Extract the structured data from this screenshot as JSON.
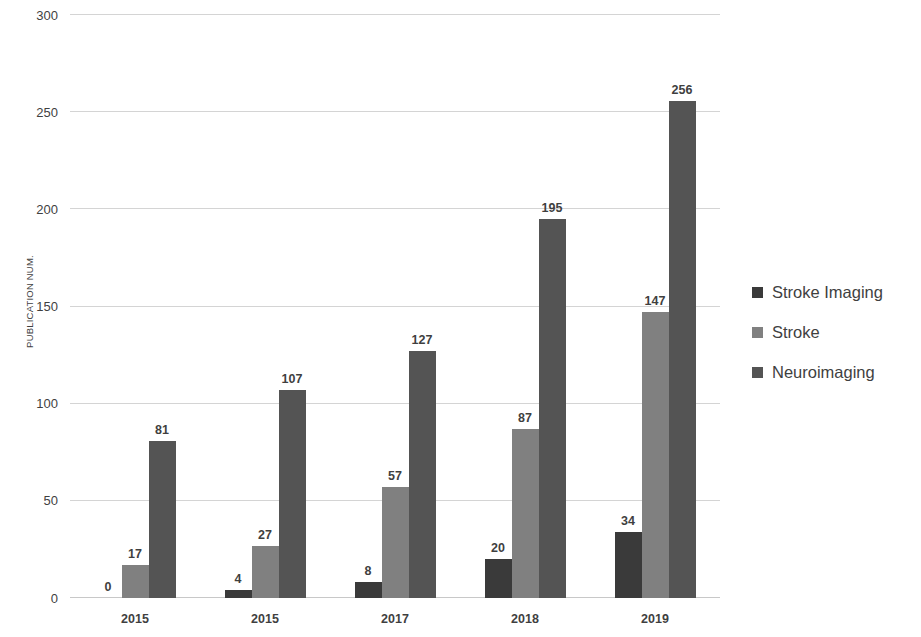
{
  "chart_data": {
    "type": "bar",
    "title": "",
    "subtitle": "",
    "xlabel": "",
    "ylabel": "PUBLICATION NUM.",
    "categories": [
      "2015",
      "2015",
      "2017",
      "2018",
      "2019"
    ],
    "series": [
      {
        "name": "Stroke Imaging",
        "color": "#3a3a3a",
        "values": [
          0,
          4,
          8,
          20,
          34
        ]
      },
      {
        "name": "Stroke",
        "color": "#808080",
        "values": [
          17,
          27,
          57,
          87,
          147
        ]
      },
      {
        "name": "Neuroimaging",
        "color": "#545454",
        "values": [
          81,
          107,
          127,
          195,
          256
        ]
      }
    ],
    "ylim": [
      0,
      300
    ],
    "yticks": [
      0,
      50,
      100,
      150,
      200,
      250,
      300
    ],
    "ytick_labels": [
      "0",
      "50",
      "100",
      "150",
      "200",
      "250",
      "300"
    ],
    "grid": true,
    "grid_axis": "y",
    "legend_position": "right",
    "data_labels": true,
    "background": "#ffffff",
    "gridline_color": "#d4d4d4",
    "text_color": "#3f3f3f"
  }
}
